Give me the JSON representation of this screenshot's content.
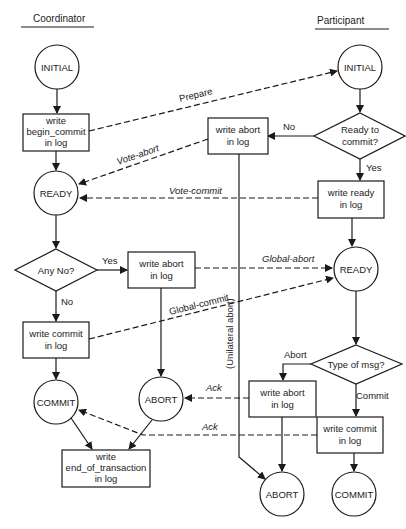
{
  "headers": {
    "coordinator": "Coordinator",
    "participant": "Participant"
  },
  "coordinator": {
    "initial": "INITIAL",
    "begin_commit": [
      "write",
      "begin_commit",
      "in log"
    ],
    "ready": "READY",
    "any_no": "Any No?",
    "yes": "Yes",
    "no": "No",
    "write_abort": [
      "write abort",
      "in log"
    ],
    "write_commit": [
      "write commit",
      "in log"
    ],
    "commit": "COMMIT",
    "abort": "ABORT",
    "end_of_transaction": [
      "write",
      "end_of_transaction",
      "in log"
    ]
  },
  "participant": {
    "initial": "INITIAL",
    "ready_to_commit": [
      "Ready to",
      "commit?"
    ],
    "no": "No",
    "yes": "Yes",
    "write_abort_1": [
      "write abort",
      "in log"
    ],
    "write_ready": [
      "write ready",
      "in log"
    ],
    "ready": "READY",
    "type_of_msg": "Type of msg?",
    "abort_label": "Abort",
    "commit_label": "Commit",
    "write_abort_2": [
      "write abort",
      "in log"
    ],
    "write_commit": [
      "write commit",
      "in log"
    ],
    "abort": "ABORT",
    "commit": "COMMIT",
    "unilateral": "(Unilateral abort)"
  },
  "messages": {
    "prepare": "Prepare",
    "vote_abort": "Vote-abort",
    "vote_commit": "Vote-commit",
    "global_abort": "Global-abort",
    "global_commit": "Global-commit",
    "ack1": "Ack",
    "ack2": "Ack"
  }
}
